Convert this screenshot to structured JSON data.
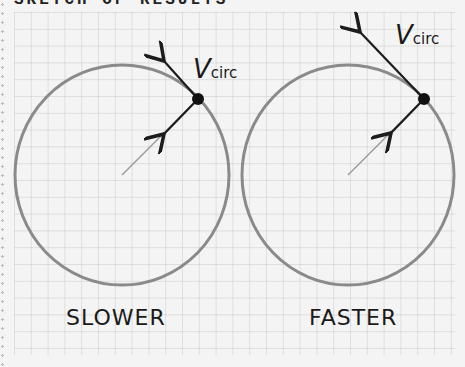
{
  "header": {
    "title": "SKETCH OF RESULTS"
  },
  "panels": [
    {
      "label": "SLOWER",
      "vector_label": "V",
      "vector_subscript": "circ"
    },
    {
      "label": "FASTER",
      "vector_label": "V",
      "vector_subscript": "circ"
    }
  ],
  "colors": {
    "grid": "#c8c8c8",
    "orbit": "#8a8a8a",
    "arrow": "#1c1c1c",
    "radius": "#9a9a9a",
    "background": "#f4f4f4"
  }
}
